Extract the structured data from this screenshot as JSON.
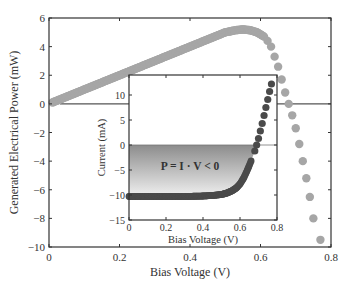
{
  "chart_data": [
    {
      "id": "main",
      "type": "scatter",
      "title": "",
      "xlabel": "Bias Voltage (V)",
      "ylabel": "Generated Electrical Power (mW)",
      "xlim": [
        0,
        0.8
      ],
      "ylim": [
        -10,
        6
      ],
      "xticks": [
        0,
        0.2,
        0.4,
        0.6,
        0.8
      ],
      "xtick_labels": [
        "0",
        "0.2",
        "0.4",
        "0.6",
        "0.8"
      ],
      "yticks": [
        6,
        4,
        2,
        0,
        -2,
        -4,
        -6,
        -8,
        -10
      ],
      "ytick_labels": [
        "6",
        "4",
        "2",
        "0",
        "−2",
        "−4",
        "−6",
        "−8",
        "−10"
      ],
      "grid": false,
      "reference_line": {
        "y": 0
      },
      "series": [
        {
          "name": "Generated power",
          "color": "#a6a6a6",
          "x": [
            0.01,
            0.05,
            0.1,
            0.15,
            0.2,
            0.25,
            0.3,
            0.35,
            0.4,
            0.45,
            0.5,
            0.53,
            0.55,
            0.57,
            0.59,
            0.61,
            0.62,
            0.63,
            0.64,
            0.65,
            0.66,
            0.67,
            0.68,
            0.69,
            0.7,
            0.71,
            0.72,
            0.73,
            0.74,
            0.75,
            0.77
          ],
          "y": [
            0.1,
            0.5,
            1.0,
            1.5,
            2.0,
            2.5,
            3.0,
            3.5,
            4.0,
            4.5,
            5.0,
            5.15,
            5.2,
            5.15,
            5.0,
            4.7,
            4.4,
            4.0,
            3.3,
            2.6,
            1.7,
            0.8,
            0.0,
            -0.8,
            -1.7,
            -2.8,
            -4.0,
            -5.2,
            -6.5,
            -8.0,
            -9.5
          ]
        }
      ]
    },
    {
      "id": "inset",
      "type": "scatter",
      "title": "",
      "xlabel": "Bias Voltage (V)",
      "ylabel": "Current (mA)",
      "xlim": [
        0,
        0.8
      ],
      "ylim": [
        -15,
        14
      ],
      "xticks": [
        0,
        0.2,
        0.4,
        0.6,
        0.8
      ],
      "xtick_labels": [
        "0",
        "0.2",
        "0.4",
        "0.6",
        "0.8"
      ],
      "yticks": [
        10,
        5,
        0,
        -5,
        -10,
        -15
      ],
      "ytick_labels": [
        "10",
        "5",
        "0",
        "−5",
        "−10",
        "−15"
      ],
      "grid": false,
      "reference_line": {
        "y": 0
      },
      "annotation": "P = I · V < 0",
      "shaded_region": {
        "description": "area between I=0 and the I-V curve where power is generated",
        "color_top": "#8c8c8c",
        "color_bottom": "#f0f0f0"
      },
      "series": [
        {
          "name": "I-V curve",
          "color": "#4a4a4a",
          "x": [
            0.0,
            0.05,
            0.1,
            0.15,
            0.2,
            0.25,
            0.3,
            0.35,
            0.4,
            0.45,
            0.5,
            0.53,
            0.56,
            0.58,
            0.6,
            0.62,
            0.64,
            0.66,
            0.68,
            0.69,
            0.7,
            0.71,
            0.72,
            0.73,
            0.74,
            0.75,
            0.76,
            0.77
          ],
          "y": [
            -10.3,
            -10.3,
            -10.3,
            -10.3,
            -10.3,
            -10.3,
            -10.3,
            -10.25,
            -10.2,
            -10.1,
            -9.9,
            -9.6,
            -9.1,
            -8.6,
            -7.8,
            -6.6,
            -5.0,
            -3.2,
            -1.2,
            0.0,
            1.3,
            2.8,
            4.3,
            5.9,
            7.5,
            9.1,
            10.7,
            12.2
          ]
        }
      ]
    }
  ]
}
